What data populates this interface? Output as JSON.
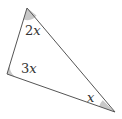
{
  "diagram": {
    "type": "triangle",
    "vertices": {
      "top": {
        "x": 27,
        "y": 8
      },
      "left": {
        "x": 7,
        "y": 74
      },
      "right": {
        "x": 115,
        "y": 112
      }
    },
    "angles": [
      {
        "vertex": "top",
        "coef": "2",
        "var": "x"
      },
      {
        "vertex": "left",
        "coef": "3",
        "var": "x"
      },
      {
        "vertex": "right",
        "coef": "",
        "var": "x"
      }
    ],
    "colors": {
      "line": "#555555",
      "angle_fill": "#c8c8c8",
      "label": "#333333"
    }
  }
}
